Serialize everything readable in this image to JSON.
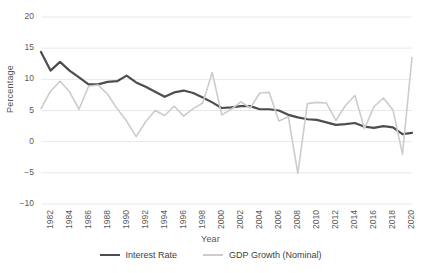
{
  "chart_data": {
    "type": "line",
    "title": "",
    "xlabel": "Year",
    "ylabel": "Percentage",
    "ylim": [
      -10,
      20
    ],
    "xlim": [
      1982,
      2021
    ],
    "grid": true,
    "legend_position": "bottom",
    "ytick_labels": [
      "20",
      "15",
      "10",
      "5",
      "0",
      "−5",
      "−10"
    ],
    "ytick_values": [
      20,
      15,
      10,
      5,
      0,
      -5,
      -10
    ],
    "xtick_labels": [
      "1982",
      "1984",
      "1986",
      "1988",
      "1990",
      "1992",
      "1994",
      "1996",
      "1998",
      "2000",
      "2002",
      "2004",
      "2006",
      "2008",
      "2010",
      "2012",
      "2014",
      "2016",
      "2018",
      "2020"
    ],
    "xtick_values": [
      1982,
      1984,
      1986,
      1988,
      1990,
      1992,
      1994,
      1996,
      1998,
      2000,
      2002,
      2004,
      2006,
      2008,
      2010,
      2012,
      2014,
      2016,
      2018,
      2020
    ],
    "x": [
      1982,
      1983,
      1984,
      1985,
      1986,
      1987,
      1988,
      1989,
      1990,
      1991,
      1992,
      1993,
      1994,
      1995,
      1996,
      1997,
      1998,
      1999,
      2000,
      2001,
      2002,
      2003,
      2004,
      2005,
      2006,
      2007,
      2008,
      2009,
      2010,
      2011,
      2012,
      2013,
      2014,
      2015,
      2016,
      2017,
      2018,
      2019,
      2020,
      2021
    ],
    "series": [
      {
        "name": "Interest Rate",
        "color": "#4d4d4d",
        "width": 2.2,
        "values": [
          14.4,
          11.4,
          12.8,
          11.4,
          10.3,
          9.2,
          9.2,
          9.6,
          9.7,
          10.6,
          9.5,
          8.8,
          8.0,
          7.2,
          7.9,
          8.2,
          7.8,
          7.1,
          6.3,
          5.4,
          5.5,
          5.7,
          5.7,
          5.2,
          5.2,
          5.0,
          4.3,
          3.9,
          3.6,
          3.5,
          3.1,
          2.7,
          2.8,
          3.0,
          2.4,
          2.2,
          2.5,
          2.3,
          1.2,
          1.4
        ]
      },
      {
        "name": "GDP Growth (Nominal)",
        "color": "#cccccc",
        "width": 1.6,
        "values": [
          5.3,
          8.1,
          9.7,
          8.0,
          5.2,
          8.9,
          9.1,
          7.6,
          5.3,
          3.3,
          0.8,
          3.2,
          5.0,
          4.2,
          5.7,
          4.1,
          5.3,
          6.2,
          11.1,
          4.3,
          5.2,
          6.4,
          5.4,
          7.8,
          7.9,
          3.3,
          4.0,
          -5.1,
          6.1,
          6.3,
          6.2,
          3.4,
          5.8,
          7.4,
          2.1,
          5.6,
          7.0,
          5.1,
          -2.0,
          13.5
        ]
      }
    ]
  },
  "legend": {
    "items": [
      {
        "label": "Interest Rate",
        "color": "#4d4d4d"
      },
      {
        "label": "GDP Growth (Nominal)",
        "color": "#cccccc"
      }
    ]
  }
}
